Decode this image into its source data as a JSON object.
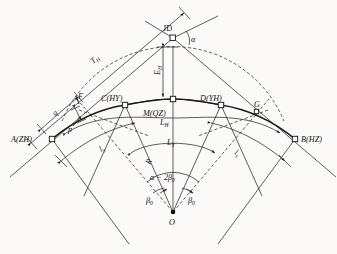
{
  "figure": {
    "type": "engineering-diagram",
    "background_color": "#fbfaf8",
    "line_color": "#1a1a1a"
  },
  "points": {
    "jd": {
      "label": "JD",
      "x": 173,
      "y": 38,
      "desc": "intersection-point-of-tangents"
    },
    "zh": {
      "label": "A(ZH)",
      "x": 52,
      "y": 139,
      "desc": "tangent-to-spiral"
    },
    "hy": {
      "label": "C(HY)",
      "x": 125,
      "y": 105,
      "desc": "spiral-to-circular"
    },
    "qz": {
      "label": "M(QZ)",
      "x": 173,
      "y": 99,
      "desc": "mid-point-of-curve"
    },
    "yh": {
      "label": "D(YH)",
      "x": 221,
      "y": 105,
      "desc": "circular-to-spiral"
    },
    "hz": {
      "label": "B(HZ)",
      "x": 295,
      "y": 139,
      "desc": "spiral-to-tangent"
    },
    "o": {
      "label": "O",
      "x": 173,
      "y": 212,
      "desc": "curve-centre"
    },
    "g": {
      "label": "G",
      "x": 257,
      "y": 112,
      "desc": "auxiliary-point-on-tangent"
    },
    "f": {
      "label": "F",
      "x": 77,
      "y": 100,
      "desc": "auxiliary-point-shifted-origin"
    }
  },
  "labels": {
    "jd": "JD",
    "zh": "A(ZH)",
    "hy": "C(HY)",
    "qz": "M(QZ)",
    "yh": "D(YH)",
    "hz": "B(HZ)",
    "o": "O",
    "g": "G",
    "f": "F",
    "alpha": "α",
    "tangent_T": "T",
    "tangent_T_sub": "H",
    "external_E": "E",
    "external_E_sub": "H",
    "curve_LH": "L",
    "curve_LH_sub": "H",
    "curve_LY": "L",
    "curve_LY_sub": "Y",
    "spiral_ls_left": "l",
    "spiral_ls_left_sub": "s",
    "spiral_ls_right": "l",
    "spiral_ls_right_sub": "s",
    "radius_R": "R",
    "shift_p": "p",
    "shift_q": "q",
    "central_angle": "α − 2β",
    "central_angle_sub": "0",
    "beta_left": "β",
    "beta_left_sub": "0",
    "beta_right": "β",
    "beta_right_sub": "0"
  },
  "geometry": {
    "radius_px": 113,
    "center_x": 173,
    "center_y": 212,
    "zh_angle_deg": 211,
    "hz_angle_deg": 329,
    "hy_angle_deg": 227,
    "yh_angle_deg": 313,
    "qz_angle_deg": 270
  },
  "legend_notes": {
    "zh_meaning": "ZH = straight-to-spiral",
    "hy_meaning": "HY = spiral-to-circular",
    "qz_meaning": "QZ = mid point of curve",
    "yh_meaning": "YH = circular-to-spiral",
    "hz_meaning": "HZ = spiral-to-straight"
  }
}
